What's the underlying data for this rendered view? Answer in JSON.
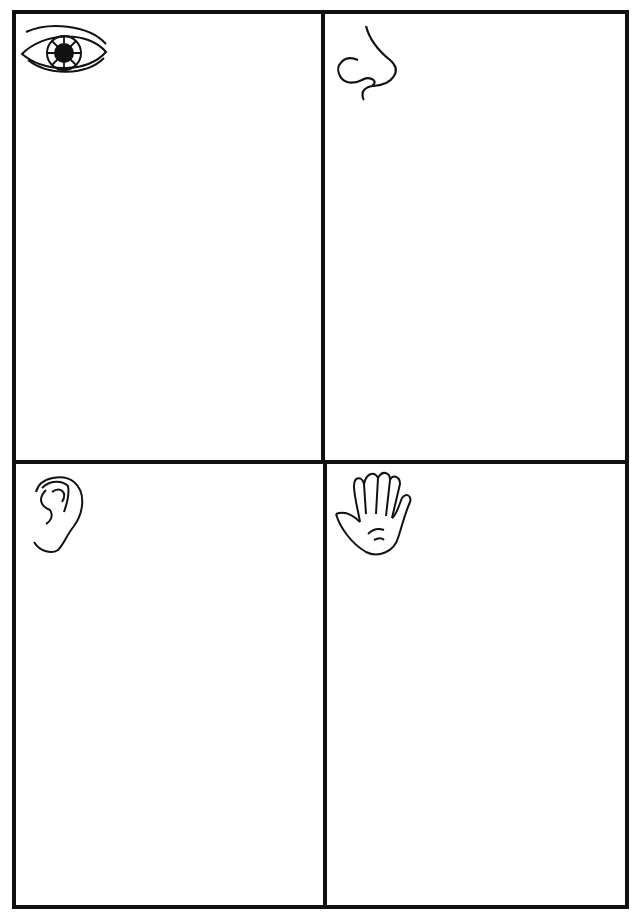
{
  "worksheet": {
    "title": "Five senses worksheet grid",
    "colors": {
      "border": "#111111",
      "background": "#ffffff"
    },
    "panels": [
      {
        "id": "sight",
        "icon": "eye-icon"
      },
      {
        "id": "smell",
        "icon": "nose-icon"
      },
      {
        "id": "hearing",
        "icon": "ear-icon"
      },
      {
        "id": "touch",
        "icon": "hand-icon"
      }
    ]
  }
}
